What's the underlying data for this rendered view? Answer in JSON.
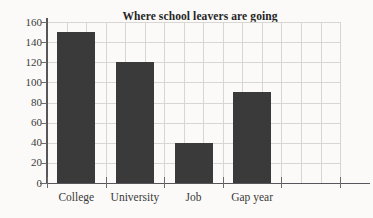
{
  "chart_data": {
    "type": "bar",
    "title": "Where school leavers are going",
    "xlabel": "",
    "ylabel": "",
    "categories": [
      "College",
      "University",
      "Job",
      "Gap year"
    ],
    "values": [
      150,
      120,
      40,
      90
    ],
    "ylim": [
      0,
      160
    ],
    "ytick_step": 20,
    "yticks": [
      0,
      20,
      40,
      60,
      80,
      100,
      120,
      140,
      160
    ],
    "ytick_labels": [
      "0",
      "20",
      "40",
      "60",
      "80",
      "100",
      "120",
      "140",
      "160"
    ],
    "grid": true,
    "legend": false,
    "legend_position": "none",
    "bar_color": "#3a3a3a",
    "grid_color": "#d8d6d2",
    "axis_color": "#58565a",
    "background_color": "#fbfaf8"
  }
}
